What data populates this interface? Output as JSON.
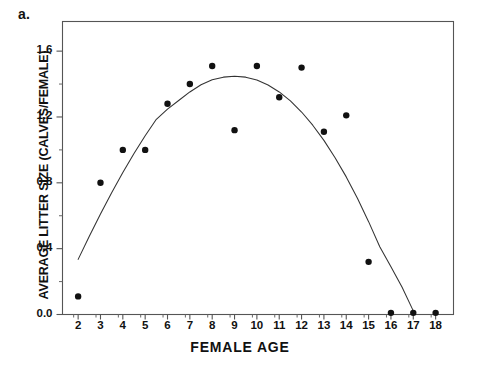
{
  "figure": {
    "panel_label": "a.",
    "background": "#ffffff",
    "ink_color": "#1a1a1a"
  },
  "chart_data": {
    "type": "scatter",
    "title": "",
    "subtitle": "",
    "xlabel": "FEMALE AGE",
    "ylabel": "AVERAGE LITTER SIZE (CALVES/FEMALE)",
    "xlim": [
      1.3,
      18.8
    ],
    "ylim": [
      0.0,
      1.78
    ],
    "grid": false,
    "legend": null,
    "x_major_ticks": [
      2,
      3,
      4,
      5,
      6,
      7,
      8,
      9,
      10,
      11,
      12,
      13,
      14,
      15,
      16,
      17,
      18
    ],
    "x_tick_labels": [
      "2",
      "3",
      "4",
      "5",
      "6",
      "7",
      "8",
      "9",
      "10",
      "11",
      "12",
      "13",
      "14",
      "15",
      "16",
      "17",
      "18"
    ],
    "y_major_ticks": [
      0.0,
      0.4,
      0.8,
      1.2,
      1.6
    ],
    "y_tick_labels": [
      "0.0",
      "0.4",
      "0.8",
      "1.2",
      "1.6"
    ],
    "y_minor_ticks": [
      0.2,
      0.6,
      1.0,
      1.4
    ],
    "x": [
      2,
      3,
      4,
      5,
      6,
      7,
      8,
      9,
      10,
      11,
      12,
      13,
      14,
      15,
      16,
      17,
      18
    ],
    "values": [
      0.11,
      0.8,
      1.0,
      1.0,
      1.28,
      1.4,
      1.51,
      1.12,
      1.51,
      1.32,
      1.5,
      1.11,
      1.21,
      0.32,
      0.01,
      0.01,
      0.01
    ],
    "series": [
      {
        "name": "observed",
        "marker": "filled-circle",
        "color": "#111111",
        "points": [
          {
            "x": 2,
            "y": 0.11
          },
          {
            "x": 3,
            "y": 0.8
          },
          {
            "x": 4,
            "y": 1.0
          },
          {
            "x": 5,
            "y": 1.0
          },
          {
            "x": 6,
            "y": 1.28
          },
          {
            "x": 7,
            "y": 1.4
          },
          {
            "x": 8,
            "y": 1.51
          },
          {
            "x": 9,
            "y": 1.12
          },
          {
            "x": 10,
            "y": 1.51
          },
          {
            "x": 11,
            "y": 1.32
          },
          {
            "x": 12,
            "y": 1.5
          },
          {
            "x": 13,
            "y": 1.11
          },
          {
            "x": 14,
            "y": 1.21
          },
          {
            "x": 15,
            "y": 0.32
          },
          {
            "x": 16,
            "y": 0.01
          },
          {
            "x": 17,
            "y": 0.01
          },
          {
            "x": 18,
            "y": 0.01
          }
        ]
      },
      {
        "name": "fitted-quadratic-curve",
        "marker": "none",
        "line": "solid",
        "color": "#333333",
        "x_range": [
          2.0,
          17.1
        ],
        "points": [
          {
            "x": 2.0,
            "y": 0.335
          },
          {
            "x": 2.5,
            "y": 0.475
          },
          {
            "x": 3.0,
            "y": 0.61
          },
          {
            "x": 3.5,
            "y": 0.74
          },
          {
            "x": 4.0,
            "y": 0.862
          },
          {
            "x": 4.5,
            "y": 0.978
          },
          {
            "x": 5.0,
            "y": 1.086
          },
          {
            "x": 5.5,
            "y": 1.186
          },
          {
            "x": 6.0,
            "y": 1.248
          },
          {
            "x": 6.5,
            "y": 1.3
          },
          {
            "x": 7.0,
            "y": 1.352
          },
          {
            "x": 7.5,
            "y": 1.396
          },
          {
            "x": 8.0,
            "y": 1.426
          },
          {
            "x": 8.5,
            "y": 1.442
          },
          {
            "x": 9.0,
            "y": 1.448
          },
          {
            "x": 9.5,
            "y": 1.442
          },
          {
            "x": 10.0,
            "y": 1.424
          },
          {
            "x": 10.5,
            "y": 1.394
          },
          {
            "x": 11.0,
            "y": 1.352
          },
          {
            "x": 11.5,
            "y": 1.298
          },
          {
            "x": 12.0,
            "y": 1.23
          },
          {
            "x": 12.5,
            "y": 1.15
          },
          {
            "x": 13.0,
            "y": 1.058
          },
          {
            "x": 13.5,
            "y": 0.952
          },
          {
            "x": 14.0,
            "y": 0.836
          },
          {
            "x": 14.5,
            "y": 0.706
          },
          {
            "x": 15.0,
            "y": 0.564
          },
          {
            "x": 15.5,
            "y": 0.412
          },
          {
            "x": 16.0,
            "y": 0.29
          },
          {
            "x": 16.5,
            "y": 0.165
          },
          {
            "x": 17.0,
            "y": 0.022
          },
          {
            "x": 17.1,
            "y": 0.0
          }
        ]
      }
    ],
    "annotations": []
  }
}
